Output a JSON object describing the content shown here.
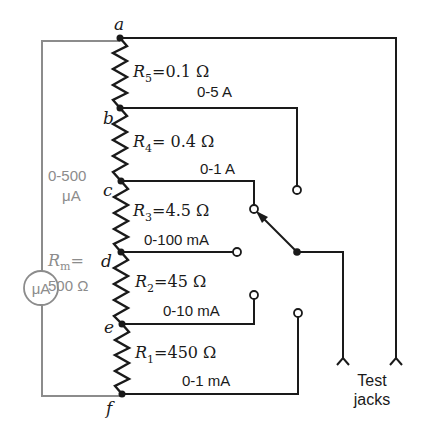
{
  "nodes": {
    "a": "a",
    "b": "b",
    "c": "c",
    "d": "d",
    "e": "e",
    "f": "f"
  },
  "resistors": [
    {
      "id": "R5",
      "symbol": "R",
      "sub": "5",
      "value": "=0.1 Ω",
      "range": "0-5 A"
    },
    {
      "id": "R4",
      "symbol": "R",
      "sub": "4",
      "value": "= 0.4 Ω",
      "range": "0-1 A"
    },
    {
      "id": "R3",
      "symbol": "R",
      "sub": "3",
      "value": "=4.5 Ω",
      "range": "0-100 mA"
    },
    {
      "id": "R2",
      "symbol": "R",
      "sub": "2",
      "value": "=45 Ω",
      "range": "0-10 mA"
    },
    {
      "id": "R1",
      "symbol": "R",
      "sub": "1",
      "value": "=450 Ω",
      "range": "0-1 mA"
    }
  ],
  "meter": {
    "symbol": "μA",
    "range_line1": "0-500",
    "range_line2": "μA",
    "resistance_symbol": "R",
    "resistance_sub": "m",
    "resistance_eq": "=",
    "resistance_value": "500 Ω"
  },
  "jacks": {
    "label_line1": "Test",
    "label_line2": "jacks"
  },
  "colors": {
    "wire": "#1a1a1a",
    "meter": "#8c8c8c",
    "background": "#ffffff"
  }
}
